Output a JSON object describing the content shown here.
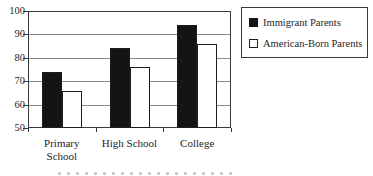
{
  "chart_data": {
    "type": "bar",
    "title": "",
    "categories": [
      "Primary School",
      "High School",
      "College"
    ],
    "category_label_lines": [
      [
        "Primary",
        "School"
      ],
      [
        "High School"
      ],
      [
        "College"
      ]
    ],
    "series": [
      {
        "name": "Immigrant Parents",
        "swatch": "black-filled-square",
        "fill": "solid",
        "values": [
          74,
          84,
          94
        ]
      },
      {
        "name": "American-Born Parents",
        "swatch": "white-outlined-square",
        "fill": "outline",
        "values": [
          66,
          76,
          86
        ]
      }
    ],
    "ylim": [
      50,
      100
    ],
    "yticks": [
      50,
      60,
      70,
      80,
      90,
      100
    ],
    "grid": true,
    "legend_position": "top-right"
  },
  "colors": {
    "bar_fill": "#141414",
    "bar_border": "#1d1d1d",
    "gridline": "#8a8a8a",
    "axis": "#3a3a3a",
    "text": "#1e1e1e",
    "background": "#ffffff"
  }
}
